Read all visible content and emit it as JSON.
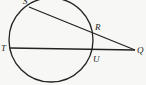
{
  "diagram": {
    "type": "geometry-circle-secants",
    "circle": {
      "cx": 51,
      "cy": 40,
      "r": 42,
      "stroke": "#222222"
    },
    "points": {
      "S": {
        "label": "S",
        "x": 29,
        "y": 7
      },
      "R": {
        "label": "R",
        "x": 91,
        "y": 30
      },
      "T": {
        "label": "T",
        "x": 10,
        "y": 48
      },
      "U": {
        "label": "U",
        "x": 91,
        "y": 50
      },
      "Q": {
        "label": "Q",
        "x": 136,
        "y": 50
      }
    },
    "segments": [
      {
        "from": "S",
        "to": "Q",
        "description": "secant through R"
      },
      {
        "from": "T",
        "to": "Q",
        "description": "secant through U"
      }
    ],
    "labels": {
      "S": "S",
      "R": "R",
      "T": "T",
      "U": "U",
      "Q": "Q"
    },
    "colors": {
      "line": "#222222",
      "background": "#f7f7f5"
    }
  }
}
